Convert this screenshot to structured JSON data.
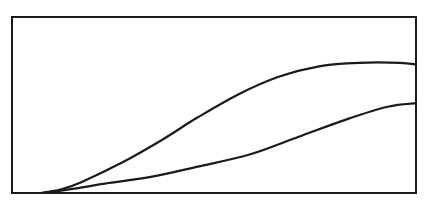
{
  "chart_data": {
    "type": "line",
    "title": "",
    "xlabel": "",
    "ylabel": "",
    "grid": false,
    "legend": null,
    "xlim": [
      0,
      1
    ],
    "ylim": [
      0,
      1
    ],
    "x": [
      0.07,
      0.17,
      0.27,
      0.37,
      0.46,
      0.56,
      0.66,
      0.76,
      0.86,
      0.96,
      1.0
    ],
    "series": [
      {
        "name": "upper-curve",
        "x": [
          0.07,
          0.12,
          0.17,
          0.27,
          0.37,
          0.46,
          0.56,
          0.66,
          0.76,
          0.86,
          0.96,
          1.0
        ],
        "values": [
          0.0,
          0.02,
          0.06,
          0.17,
          0.3,
          0.43,
          0.56,
          0.66,
          0.72,
          0.74,
          0.74,
          0.73
        ]
      },
      {
        "name": "lower-curve",
        "x": [
          0.08,
          0.17,
          0.22,
          0.34,
          0.46,
          0.59,
          0.71,
          0.83,
          0.93,
          1.0
        ],
        "values": [
          0.0,
          0.03,
          0.05,
          0.09,
          0.15,
          0.22,
          0.32,
          0.42,
          0.49,
          0.51
        ]
      }
    ]
  },
  "plot_box": {
    "left": 12,
    "top": 17,
    "right": 416,
    "bottom": 193
  },
  "colors": {
    "line": "#1a1a1a",
    "background": "#ffffff"
  }
}
